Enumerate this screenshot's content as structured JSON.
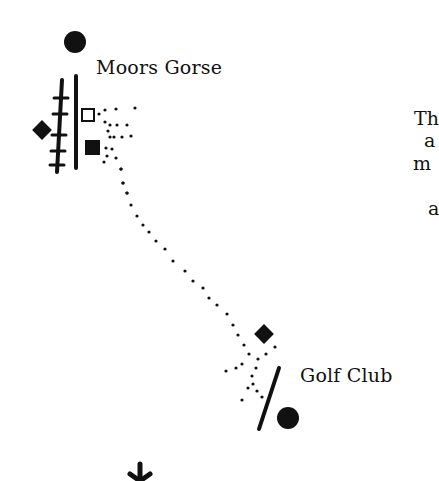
{
  "diagram": {
    "type": "route-map-schematic",
    "stations": [
      {
        "id": "moors-gorse",
        "label": "Moors Gorse",
        "marker": "filled-circle"
      },
      {
        "id": "golf-club",
        "label": "Golf Club",
        "marker": "filled-circle"
      }
    ],
    "side_text_fragments": [
      "Th",
      "a",
      "m",
      "a"
    ],
    "symbols": [
      {
        "name": "railway-track",
        "glyph": "hatched-line"
      },
      {
        "name": "road",
        "glyph": "solid-line"
      },
      {
        "name": "open-square",
        "glyph": "□"
      },
      {
        "name": "filled-square",
        "glyph": "■"
      },
      {
        "name": "filled-diamond",
        "glyph": "◆"
      },
      {
        "name": "footpath",
        "glyph": "dotted-line"
      },
      {
        "name": "asterisk",
        "glyph": "✱"
      }
    ],
    "colors": {
      "ink": "#111111",
      "background": "#ffffff"
    }
  }
}
